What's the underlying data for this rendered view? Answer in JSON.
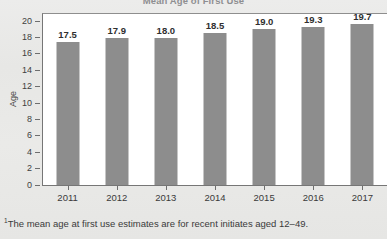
{
  "chart_data": {
    "type": "bar",
    "title": "Mean Age of First Use",
    "xlabel": "",
    "ylabel": "Age",
    "categories": [
      "2011",
      "2012",
      "2013",
      "2014",
      "2015",
      "2016",
      "2017"
    ],
    "values": [
      17.5,
      17.9,
      18.0,
      18.5,
      19.0,
      19.3,
      19.7
    ],
    "value_labels": [
      "17.5",
      "17.9",
      "18.0",
      "18.5",
      "19.0",
      "19.3",
      "19.7"
    ],
    "ylim": [
      0,
      21
    ],
    "yticks": [
      0,
      2,
      4,
      6,
      8,
      10,
      12,
      14,
      16,
      18,
      20
    ],
    "ytick_labels": [
      "0",
      "2",
      "4",
      "6",
      "8",
      "10",
      "12",
      "14",
      "16",
      "18",
      "20"
    ],
    "grid": false,
    "legend": "none",
    "bar_color": "#8d8d8d",
    "plot_background": "#ffffff",
    "page_background": "#e9e9e7",
    "axis_color": "#767676"
  },
  "footnote": {
    "marker": "1",
    "text": "The mean age at first use estimates are for recent initiates aged 12–49."
  }
}
